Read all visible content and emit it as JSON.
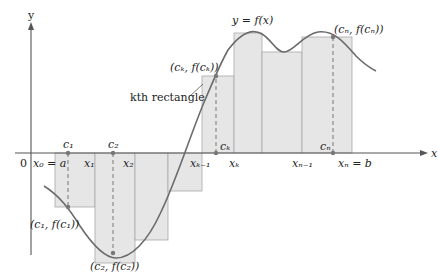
{
  "diagram": {
    "type": "riemann-sum",
    "curve_label": "y = f(x)",
    "axes": {
      "x_label": "x",
      "y_label": "y",
      "origin_label": "0"
    },
    "x_axis_labels": [
      {
        "id": "x0",
        "text": "x₀ = a"
      },
      {
        "id": "x1",
        "text": "x₁"
      },
      {
        "id": "x2",
        "text": "x₂"
      },
      {
        "id": "xk_1",
        "text": "xₖ₋₁"
      },
      {
        "id": "xk",
        "text": "xₖ"
      },
      {
        "id": "xn_1",
        "text": "xₙ₋₁"
      },
      {
        "id": "xn",
        "text": "xₙ = b"
      }
    ],
    "sample_points": [
      {
        "id": "c1",
        "text": "c₁",
        "point_label": "(c₁, f(c₁))"
      },
      {
        "id": "c2",
        "text": "c₂",
        "point_label": "(c₂, f(c₂))"
      },
      {
        "id": "ck",
        "text": "cₖ",
        "point_label": "(cₖ, f(cₖ))"
      },
      {
        "id": "cn",
        "text": "cₙ",
        "point_label": "(cₙ, f(cₙ))"
      }
    ],
    "annotation": "kth rectangle",
    "colors": {
      "rect_fill": "#e6e6e6",
      "rect_stroke": "#a8a8a8",
      "curve": "#6b6b6b",
      "axis": "#555555",
      "dashed": "#777777"
    }
  }
}
